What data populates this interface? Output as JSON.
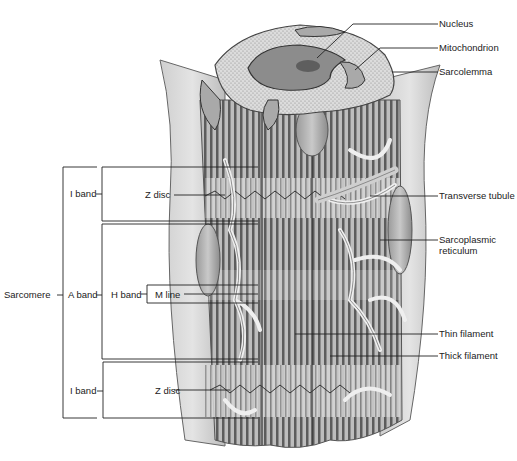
{
  "figure": {
    "right_labels": [
      {
        "id": "nucleus",
        "text": "Nucleus"
      },
      {
        "id": "mitochondrion",
        "text": "Mitochondrion"
      },
      {
        "id": "sarcolemma",
        "text": "Sarcolemma"
      },
      {
        "id": "transverse-tubule",
        "text": "Transverse tubule"
      },
      {
        "id": "sarcoplasmic-reticulum",
        "text": "Sarcoplasmic reticulum",
        "lines": [
          "Sarcoplasmic",
          "reticulum"
        ]
      },
      {
        "id": "thin-filament",
        "text": "Thin filament"
      },
      {
        "id": "thick-filament",
        "text": "Thick filament"
      }
    ],
    "left_labels": {
      "sarcomere": "Sarcomere",
      "i_band_top": "I band",
      "a_band": "A band",
      "i_band_bottom": "I band",
      "h_band": "H band",
      "m_line": "M line",
      "z_disc_top": "Z disc",
      "z_disc_bottom": "Z disc"
    },
    "colors": {
      "line": "#222222",
      "membrane": "#d8d8d8",
      "myofibril_dark": "#6e6e6e",
      "myofibril_light": "#c8c8c8",
      "reticulum": "#e6e6e6",
      "nucleus": "#8a8a8a"
    },
    "caption_partial": "(caption text cut off at bottom edge)"
  }
}
